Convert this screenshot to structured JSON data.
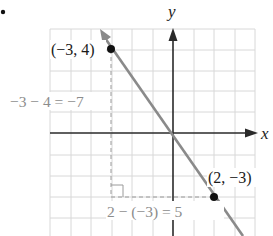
{
  "figure": {
    "bullet": "•",
    "axes": {
      "x_label": "x",
      "y_label": "y"
    },
    "grid": {
      "x_range": [
        -6,
        4
      ],
      "y_range": [
        -5,
        5
      ],
      "spacing_px": 20.5
    },
    "points": [
      {
        "label": "(−3, 4)",
        "x": -3,
        "y": 4
      },
      {
        "label": "(2, −3)",
        "x": 2,
        "y": -3
      }
    ],
    "rise_annotation": "−3 − 4 = −7",
    "run_annotation": "2 − (−3) = 5",
    "colors": {
      "grid": "#d8d8d8",
      "axis": "#2a2a2a",
      "line": "#8a8a8a",
      "point": "#111111",
      "annotation": "#8c8c8c",
      "dashed": "#9a9a9a"
    }
  }
}
